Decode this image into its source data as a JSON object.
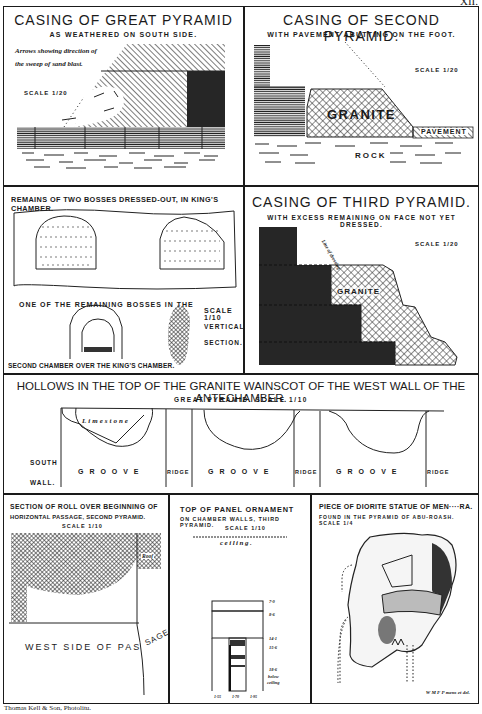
{
  "plate": {
    "number": "XII."
  },
  "panels": {
    "great_pyramid_casing": {
      "title": "CASING OF GREAT PYRAMID",
      "subtitle": "AS WEATHERED ON SOUTH SIDE.",
      "note_line1": "Arrows showing direction of",
      "note_line2": "the sweep of sand blast.",
      "scale": "SCALE 1/20"
    },
    "second_pyramid_casing": {
      "title": "CASING OF SECOND PYRAMID.",
      "subtitle": "WITH PAVEMENT ABUTTING ON THE FOOT.",
      "scale": "SCALE 1/20",
      "label_granite": "GRANITE",
      "label_pavement": "PAVEMENT",
      "label_rock": "ROCK"
    },
    "bosses": {
      "title": "REMAINS OF TWO BOSSES DRESSED-OUT, IN KING'S CHAMBER.",
      "caption_top": "ONE OF THE REMAINING BOSSES IN THE",
      "caption_bottom": "SECOND CHAMBER OVER THE KING'S CHAMBER.",
      "scale": "SCALE 1/10",
      "section_line1": "VERTICAL",
      "section_line2": "SECTION."
    },
    "third_pyramid_casing": {
      "title": "CASING OF THIRD PYRAMID.",
      "subtitle": "WITH EXCESS REMAINING ON FACE NOT YET DRESSED.",
      "scale": "SCALE 1/20",
      "label_dressing": "Line of dressing",
      "label_granite": "GRANITE"
    },
    "hollows": {
      "title": "HOLLOWS IN THE TOP OF THE GRANITE WAINSCOT OF THE WEST WALL OF THE ANTECHAMBER.",
      "subtitle": "GREAT PYRAMID. SCALE 1/10",
      "label_limestone": "Limestone",
      "south_line1": "SOUTH",
      "south_line2": "WALL.",
      "segments": [
        "G R O O V E",
        "RIDGE",
        "G R O O V E",
        "RIDGE",
        "G R O O V E",
        "RIDGE"
      ]
    },
    "roll": {
      "title_line1": "SECTION OF ROLL OVER BEGINNING OF",
      "title_line2": "HORIZONTAL PASSAGE, SECOND PYRAMID.",
      "scale": "SCALE 1/10",
      "label_roof": "Roof",
      "label_west": "WEST SIDE OF PAS",
      "label_sage": "SAGE"
    },
    "panel_ornament": {
      "title_line1": "TOP OF PANEL ORNAMENT",
      "title_line2": "ON CHAMBER WALLS, THIRD PYRAMID.",
      "scale": "SCALE 1/10",
      "label_ceiling": "ceiling.",
      "dims_right": [
        "7·0",
        "8·6",
        "14·1",
        "15·6",
        "18·6"
      ],
      "dims_below_line1": "below",
      "dims_below_line2": "ceiling",
      "dims_bottom": [
        "1·55",
        "1·70",
        "1·95"
      ]
    },
    "diorite": {
      "title_line1": "PIECE OF DIORITE STATUE OF MEN····RA.",
      "title_line2": "FOUND IN THE PYRAMID OF ABU-ROASH. SCALE 1/4",
      "signature": "W M F P mens et del."
    }
  },
  "footer": {
    "credit": "Thomas Kell & Son, Photolitu."
  }
}
